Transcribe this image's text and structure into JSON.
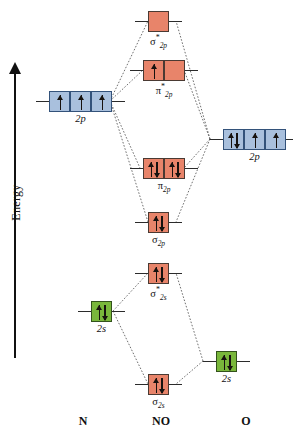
{
  "diagram": {
    "energy_axis": {
      "label": "Energy",
      "direction": "up"
    },
    "species_labels": {
      "left": "N",
      "center": "NO",
      "right": "O"
    },
    "colors": {
      "molecular_orbital": "#e8846a",
      "atomic_2p": "#a9c0dd",
      "atomic_2s": "#79b73b",
      "line": "#2b2b2b",
      "electron": "#17120f"
    },
    "levels": [
      {
        "id": "sigma-star-2p",
        "label_symbol": "σ",
        "label_star": "*",
        "label_sub": "2p",
        "boxes": 1,
        "electrons": [
          0
        ],
        "color": "molecular_orbital",
        "column": "center"
      },
      {
        "id": "pi-star-2p",
        "label_symbol": "π",
        "label_star": "*",
        "label_sub": "2p",
        "boxes": 2,
        "electrons": [
          1,
          0
        ],
        "color": "molecular_orbital",
        "column": "center"
      },
      {
        "id": "n-2p",
        "label_symbol": "2p",
        "label_star": "",
        "label_sub": "",
        "boxes": 3,
        "electrons": [
          1,
          1,
          1
        ],
        "color": "atomic_2p",
        "column": "left"
      },
      {
        "id": "o-2p",
        "label_symbol": "2p",
        "label_star": "",
        "label_sub": "",
        "boxes": 3,
        "electrons": [
          2,
          1,
          1
        ],
        "color": "atomic_2p",
        "column": "right"
      },
      {
        "id": "pi-2p",
        "label_symbol": "π",
        "label_star": "",
        "label_sub": "2p",
        "boxes": 2,
        "electrons": [
          2,
          2
        ],
        "color": "molecular_orbital",
        "column": "center"
      },
      {
        "id": "sigma-2p",
        "label_symbol": "σ",
        "label_star": "",
        "label_sub": "2p",
        "boxes": 1,
        "electrons": [
          2
        ],
        "color": "molecular_orbital",
        "column": "center"
      },
      {
        "id": "sigma-star-2s",
        "label_symbol": "σ",
        "label_star": "*",
        "label_sub": "2s",
        "boxes": 1,
        "electrons": [
          2
        ],
        "color": "molecular_orbital",
        "column": "center"
      },
      {
        "id": "n-2s",
        "label_symbol": "2s",
        "label_star": "",
        "label_sub": "",
        "boxes": 1,
        "electrons": [
          2
        ],
        "color": "atomic_2s",
        "column": "left"
      },
      {
        "id": "o-2s",
        "label_symbol": "2s",
        "label_star": "",
        "label_sub": "",
        "boxes": 1,
        "electrons": [
          2
        ],
        "color": "atomic_2s",
        "column": "right"
      },
      {
        "id": "sigma-2s",
        "label_symbol": "σ",
        "label_star": "",
        "label_sub": "2s",
        "boxes": 1,
        "electrons": [
          2
        ],
        "color": "molecular_orbital",
        "column": "center"
      }
    ],
    "labels_text": {
      "sigma_star_2p": "σ*2p",
      "pi_star_2p": "π*2p",
      "pi_2p": "π2p",
      "sigma_2p": "σ2p",
      "sigma_star_2s": "σ*2s",
      "sigma_2s": "σ2s",
      "n_2p": "2p",
      "o_2p": "2p",
      "n_2s": "2s",
      "o_2s": "2s"
    }
  }
}
